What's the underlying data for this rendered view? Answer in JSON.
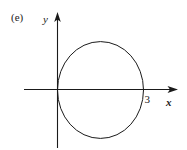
{
  "figure": {
    "part_label": "(e)",
    "background_color": "#ffffff",
    "ink_color": "#1a1a1a"
  },
  "chart_data": {
    "type": "scatter",
    "title": "(e)",
    "xlabel": "x",
    "ylabel": "y",
    "grid": false,
    "legend": null,
    "annotations": [
      {
        "name": "x-intercept",
        "text": "3",
        "x": 3,
        "y": 0
      }
    ],
    "axes": {
      "x_axis": {
        "label": "x",
        "arrow": "right",
        "tick_labels": [
          "3"
        ],
        "tick_values": [
          3
        ]
      },
      "y_axis": {
        "label": "y",
        "arrow": "up",
        "tick_labels": [],
        "tick_values": []
      },
      "origin_label": ""
    },
    "shapes": [
      {
        "name": "circle",
        "type": "circle",
        "center_x": 1.5,
        "center_y": 0,
        "radius": 1.5,
        "passes_through": [
          [
            0,
            0
          ],
          [
            3,
            0
          ],
          [
            1.5,
            1.5
          ],
          [
            1.5,
            -1.5
          ]
        ],
        "equation": "(x - 1.5)^2 + y^2 = 1.5^2",
        "filled": false,
        "stroke": "#1a1a1a"
      }
    ]
  },
  "labels": {
    "part": "(e)",
    "y_axis": "y",
    "x_axis": "x",
    "x_intercept": "3"
  }
}
